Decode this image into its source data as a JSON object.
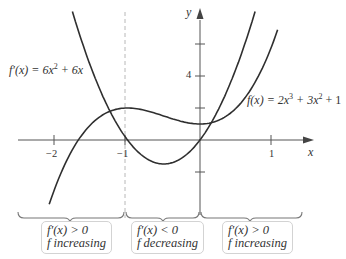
{
  "chart_data": {
    "type": "line",
    "title": "",
    "xlabel": "x",
    "ylabel": "y",
    "xlim": [
      -2.1,
      1.25
    ],
    "ylim": [
      -4.5,
      8
    ],
    "x_ticks": [
      {
        "value": -2,
        "label": "−2"
      },
      {
        "value": -1,
        "label": "−1"
      },
      {
        "value": 1,
        "label": "1"
      }
    ],
    "y_ticks": [
      {
        "value": 6,
        "label": ""
      },
      {
        "value": 4,
        "label": "4"
      },
      {
        "value": 2,
        "label": ""
      },
      {
        "value": -2,
        "label": ""
      }
    ],
    "grid": false,
    "series": [
      {
        "name": "f(x) = 2x³ + 3x² + 1",
        "expression": "2x^3 + 3x^2 + 1",
        "x_range": [
          -2.08,
          1.07
        ],
        "points": [
          [
            -2,
            -3
          ],
          [
            -1.5,
            1
          ],
          [
            -1,
            2
          ],
          [
            -0.5,
            1.5
          ],
          [
            0,
            1
          ],
          [
            0.5,
            2
          ],
          [
            1,
            6
          ]
        ]
      },
      {
        "name": "f′(x) = 6x² + 6x",
        "expression": "6x^2 + 6x",
        "x_range": [
          -1.76,
          0.76
        ],
        "points": [
          [
            -1.5,
            4.5
          ],
          [
            -1,
            0
          ],
          [
            -0.5,
            -1.5
          ],
          [
            0,
            0
          ],
          [
            0.5,
            4.5
          ]
        ]
      }
    ],
    "annotations": [
      {
        "type": "vline-dashed",
        "x": -1
      },
      {
        "type": "brace",
        "from": -2.2,
        "to": -1,
        "label_lines": [
          "f′(x) > 0",
          "f increasing"
        ]
      },
      {
        "type": "brace",
        "from": -1,
        "to": 0,
        "label_lines": [
          "f′(x) < 0",
          "f decreasing"
        ]
      },
      {
        "type": "brace",
        "from": 0,
        "to": 1.3,
        "label_lines": [
          "f′(x) > 0",
          "f increasing"
        ]
      }
    ]
  },
  "labels": {
    "y_axis": "y",
    "x_axis": "x",
    "fprime_prefix": "f′(x) = 6x",
    "fprime_exp": "2",
    "fprime_suffix": " + 6x",
    "f_prefix": "f(x) = 2x",
    "f_exp1": "3",
    "f_mid": " + 3x",
    "f_exp2": "2",
    "f_suffix": " + 1",
    "tick_neg2": "−2",
    "tick_neg1": "−1",
    "tick_1": "1",
    "tick_y4": "4"
  },
  "intervals": [
    {
      "line1": "f′(x) > 0",
      "line2": "f increasing"
    },
    {
      "line1": "f′(x) < 0",
      "line2": "f decreasing"
    },
    {
      "line1": "f′(x) > 0",
      "line2": "f increasing"
    }
  ],
  "colors": {
    "curve": "#2f2f2f",
    "axis": "#555555",
    "dashed": "#b8b8b8",
    "brace": "#777777",
    "box_border": "#d3d3d3"
  }
}
